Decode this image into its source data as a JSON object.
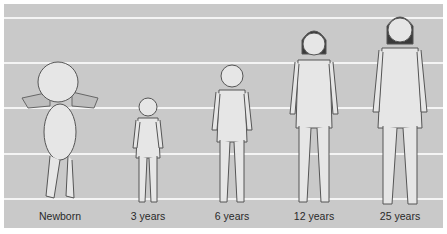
{
  "diagram": {
    "background_color": "#c9c9c9",
    "guide_line_color": "#f4f4f4",
    "guide_lines_y": [
      13,
      58,
      103,
      149,
      194
    ],
    "figures": [
      {
        "label": "Newborn",
        "center_x": 60
      },
      {
        "label": "3 years",
        "center_x": 148
      },
      {
        "label": "6 years",
        "center_x": 232
      },
      {
        "label": "12 years",
        "center_x": 314
      },
      {
        "label": "25 years",
        "center_x": 400
      }
    ]
  }
}
